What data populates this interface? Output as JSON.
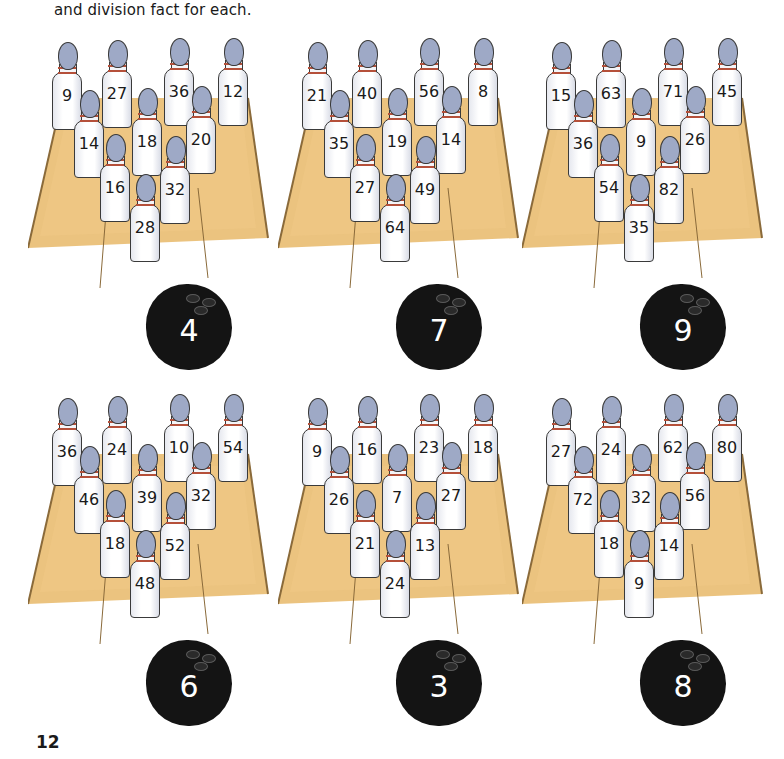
{
  "page": {
    "intro_text": "and division fact for each.",
    "page_number": "12"
  },
  "colors": {
    "lane": "#e8b868",
    "pin_head": "#9ea9c6",
    "pin_stripe": "#b5503a",
    "ball": "#141414"
  },
  "games": [
    {
      "ball": "4",
      "pins": [
        "9",
        "27",
        "36",
        "12",
        "14",
        "18",
        "20",
        "16",
        "32",
        "28"
      ]
    },
    {
      "ball": "7",
      "pins": [
        "21",
        "40",
        "56",
        "8",
        "35",
        "19",
        "14",
        "27",
        "49",
        "64"
      ]
    },
    {
      "ball": "9",
      "pins": [
        "15",
        "63",
        "71",
        "45",
        "36",
        "9",
        "26",
        "54",
        "82",
        "35"
      ]
    },
    {
      "ball": "6",
      "pins": [
        "36",
        "24",
        "10",
        "54",
        "46",
        "39",
        "32",
        "18",
        "52",
        "48"
      ]
    },
    {
      "ball": "3",
      "pins": [
        "9",
        "16",
        "23",
        "18",
        "26",
        "7",
        "27",
        "21",
        "13",
        "24"
      ]
    },
    {
      "ball": "8",
      "pins": [
        "27",
        "24",
        "62",
        "80",
        "72",
        "32",
        "56",
        "18",
        "14",
        "9"
      ]
    }
  ]
}
